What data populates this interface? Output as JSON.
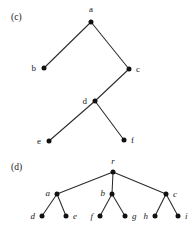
{
  "figure": {
    "background_color": "#ffffff",
    "ink_color": "#1a1a1a",
    "edge_color": "#2b2b2b",
    "node_color": "#111111"
  },
  "panels": [
    {
      "id": "panel-c",
      "caption": "(c)",
      "caption_x": 11,
      "caption_y": 20,
      "label_style": "upright",
      "nodes": [
        {
          "id": "a",
          "label": "a",
          "x": 91,
          "y": 22,
          "lx": 91,
          "ly": 12,
          "anchor": "middle"
        },
        {
          "id": "b",
          "label": "b",
          "x": 44,
          "y": 68,
          "lx": 36,
          "ly": 71,
          "anchor": "end"
        },
        {
          "id": "c",
          "label": "c",
          "x": 129,
          "y": 69,
          "lx": 136,
          "ly": 72,
          "anchor": "start"
        },
        {
          "id": "d",
          "label": "d",
          "x": 95,
          "y": 101,
          "lx": 87,
          "ly": 104,
          "anchor": "end"
        },
        {
          "id": "e",
          "label": "e",
          "x": 49,
          "y": 141,
          "lx": 41,
          "ly": 144,
          "anchor": "end"
        },
        {
          "id": "f",
          "label": "f",
          "x": 124,
          "y": 140,
          "lx": 131,
          "ly": 143,
          "anchor": "start"
        }
      ],
      "edges": [
        {
          "from": "a",
          "to": "b"
        },
        {
          "from": "a",
          "to": "c"
        },
        {
          "from": "c",
          "to": "d"
        },
        {
          "from": "d",
          "to": "e"
        },
        {
          "from": "d",
          "to": "f"
        }
      ]
    },
    {
      "id": "panel-d",
      "caption": "(d)",
      "caption_x": 11,
      "caption_y": 170,
      "label_style": "italic",
      "nodes": [
        {
          "id": "r",
          "label": "r",
          "x": 113,
          "y": 172,
          "lx": 113,
          "ly": 164,
          "anchor": "middle"
        },
        {
          "id": "a",
          "label": "a",
          "x": 57,
          "y": 194,
          "lx": 50,
          "ly": 196,
          "anchor": "end"
        },
        {
          "id": "b",
          "label": "b",
          "x": 112,
          "y": 194,
          "lx": 105,
          "ly": 196,
          "anchor": "end"
        },
        {
          "id": "c",
          "label": "c",
          "x": 166,
          "y": 194,
          "lx": 173,
          "ly": 197,
          "anchor": "start"
        },
        {
          "id": "d",
          "label": "d",
          "x": 42,
          "y": 216,
          "lx": 35,
          "ly": 219,
          "anchor": "end"
        },
        {
          "id": "e",
          "label": "e",
          "x": 66,
          "y": 216,
          "lx": 73,
          "ly": 219,
          "anchor": "start"
        },
        {
          "id": "f",
          "label": "f",
          "x": 100,
          "y": 216,
          "lx": 93,
          "ly": 219,
          "anchor": "end"
        },
        {
          "id": "g",
          "label": "g",
          "x": 125,
          "y": 216,
          "lx": 132,
          "ly": 219,
          "anchor": "start"
        },
        {
          "id": "h",
          "label": "h",
          "x": 155,
          "y": 216,
          "lx": 148,
          "ly": 219,
          "anchor": "end"
        },
        {
          "id": "i",
          "label": "i",
          "x": 178,
          "y": 216,
          "lx": 185,
          "ly": 219,
          "anchor": "start"
        }
      ],
      "edges": [
        {
          "from": "r",
          "to": "a"
        },
        {
          "from": "r",
          "to": "b"
        },
        {
          "from": "r",
          "to": "c"
        },
        {
          "from": "a",
          "to": "d"
        },
        {
          "from": "a",
          "to": "e"
        },
        {
          "from": "b",
          "to": "f"
        },
        {
          "from": "b",
          "to": "g"
        },
        {
          "from": "c",
          "to": "h"
        },
        {
          "from": "c",
          "to": "i"
        }
      ]
    }
  ]
}
